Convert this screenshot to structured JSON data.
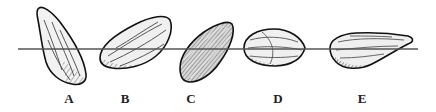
{
  "figure": {
    "type": "seed-orientation-illustration",
    "reference_line": {
      "x1": 18,
      "x2": 418,
      "y": 49,
      "color": "#555555"
    },
    "seeds": [
      {
        "id": "A",
        "label": "A",
        "label_x": 69,
        "shape": "tapered-upright"
      },
      {
        "id": "B",
        "label": "B",
        "label_x": 125,
        "shape": "tilted-oblong"
      },
      {
        "id": "C",
        "label": "C",
        "label_x": 191,
        "shape": "tilted-dark"
      },
      {
        "id": "D",
        "label": "D",
        "label_x": 278,
        "shape": "oval-flat"
      },
      {
        "id": "E",
        "label": "E",
        "label_x": 362,
        "shape": "elongated-pointed"
      }
    ]
  }
}
